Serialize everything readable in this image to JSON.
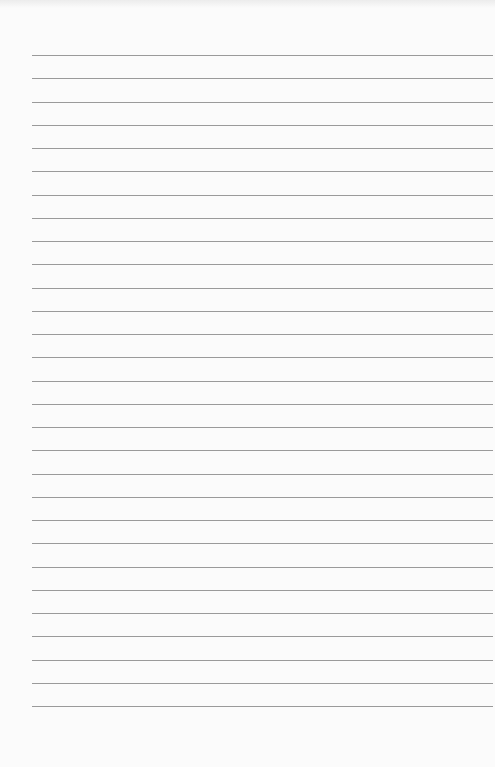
{
  "page": {
    "type": "lined-paper",
    "background_color": "#fbfbfb",
    "line_color": "#9a9a9a",
    "line_count": 29,
    "first_line_y": 55,
    "line_spacing": 23.25,
    "line_left_x": 32,
    "line_right_x": 493
  }
}
